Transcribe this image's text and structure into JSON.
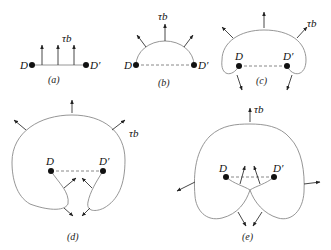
{
  "panels": [
    {
      "id": "a",
      "caption": "(a)",
      "left_label": "D",
      "right_label": "D′",
      "force_label": "τb"
    },
    {
      "id": "b",
      "caption": "(b)",
      "left_label": "D",
      "right_label": "D′",
      "force_label": "τb"
    },
    {
      "id": "c",
      "caption": "(c)",
      "left_label": "D",
      "right_label": "D′",
      "force_label": "τb"
    },
    {
      "id": "d",
      "caption": "(d)",
      "left_label": "D",
      "right_label": "D′",
      "force_label": "τb"
    },
    {
      "id": "e",
      "caption": "(e)",
      "left_label": "D",
      "right_label": "D′",
      "force_label": "τb"
    }
  ],
  "colors": {
    "line": "#8a8a8a",
    "arrow": "#333333",
    "pin": "#111111"
  }
}
